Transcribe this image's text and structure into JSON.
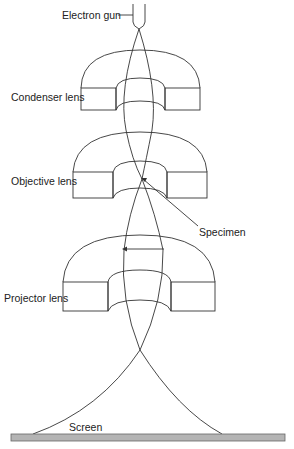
{
  "labels": {
    "electron_gun": "Electron gun",
    "condenser_lens": "Condenser lens",
    "objective_lens": "Objective lens",
    "specimen": "Specimen",
    "projector_lens": "Projector lens",
    "screen": "Screen"
  },
  "colors": {
    "line": "#333333",
    "screen_fill": "#b4b4b4",
    "screen_stroke": "#666666",
    "text": "#222222"
  }
}
